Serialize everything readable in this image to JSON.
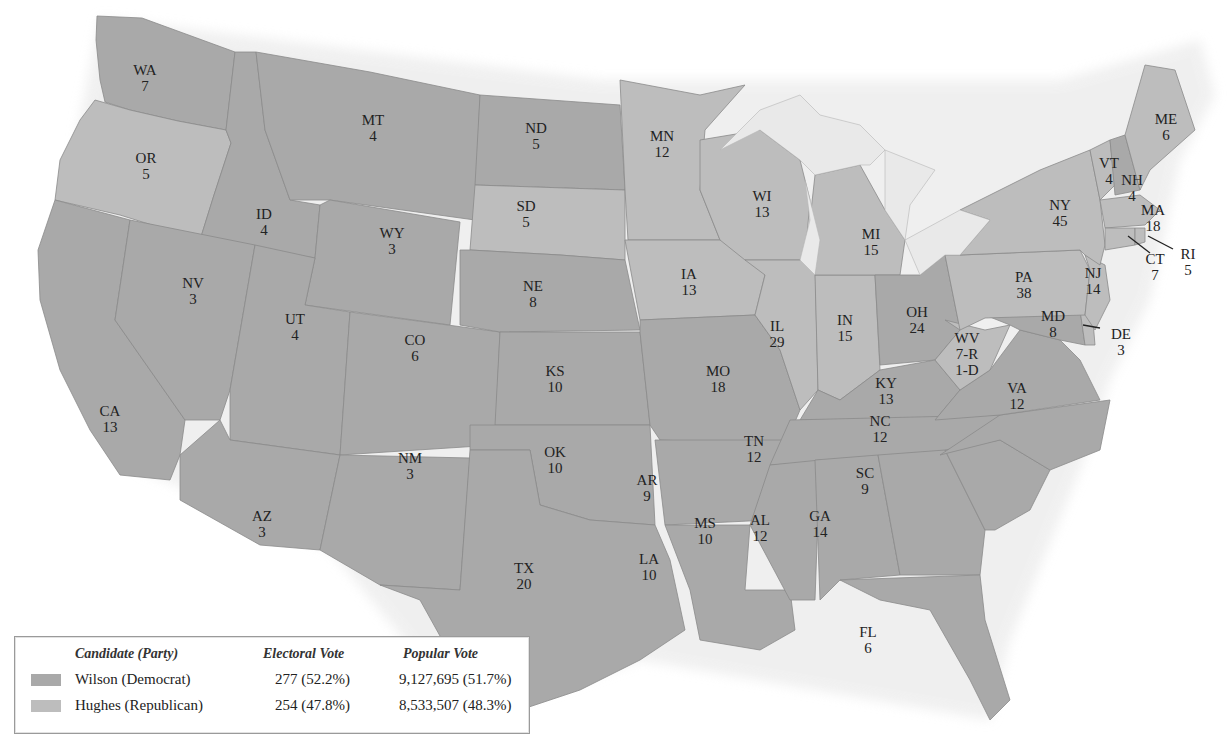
{
  "map": {
    "title": "",
    "states": [
      {
        "abbr": "WA",
        "ev": "7",
        "winner": "Wilson"
      },
      {
        "abbr": "OR",
        "ev": "5",
        "winner": "Hughes"
      },
      {
        "abbr": "CA",
        "ev": "13",
        "winner": "Wilson"
      },
      {
        "abbr": "ID",
        "ev": "4",
        "winner": "Wilson"
      },
      {
        "abbr": "NV",
        "ev": "3",
        "winner": "Wilson"
      },
      {
        "abbr": "MT",
        "ev": "4",
        "winner": "Wilson"
      },
      {
        "abbr": "WY",
        "ev": "3",
        "winner": "Wilson"
      },
      {
        "abbr": "UT",
        "ev": "4",
        "winner": "Wilson"
      },
      {
        "abbr": "AZ",
        "ev": "3",
        "winner": "Wilson"
      },
      {
        "abbr": "CO",
        "ev": "6",
        "winner": "Wilson"
      },
      {
        "abbr": "NM",
        "ev": "3",
        "winner": "Wilson"
      },
      {
        "abbr": "ND",
        "ev": "5",
        "winner": "Wilson"
      },
      {
        "abbr": "SD",
        "ev": "5",
        "winner": "Hughes"
      },
      {
        "abbr": "NE",
        "ev": "8",
        "winner": "Wilson"
      },
      {
        "abbr": "KS",
        "ev": "10",
        "winner": "Wilson"
      },
      {
        "abbr": "OK",
        "ev": "10",
        "winner": "Wilson"
      },
      {
        "abbr": "TX",
        "ev": "20",
        "winner": "Wilson"
      },
      {
        "abbr": "MN",
        "ev": "12",
        "winner": "Hughes"
      },
      {
        "abbr": "IA",
        "ev": "13",
        "winner": "Hughes"
      },
      {
        "abbr": "MO",
        "ev": "18",
        "winner": "Wilson"
      },
      {
        "abbr": "AR",
        "ev": "9",
        "winner": "Wilson"
      },
      {
        "abbr": "LA",
        "ev": "10",
        "winner": "Wilson"
      },
      {
        "abbr": "WI",
        "ev": "13",
        "winner": "Hughes"
      },
      {
        "abbr": "IL",
        "ev": "29",
        "winner": "Hughes"
      },
      {
        "abbr": "MI",
        "ev": "15",
        "winner": "Hughes"
      },
      {
        "abbr": "IN",
        "ev": "15",
        "winner": "Hughes"
      },
      {
        "abbr": "OH",
        "ev": "24",
        "winner": "Wilson"
      },
      {
        "abbr": "KY",
        "ev": "13",
        "winner": "Wilson"
      },
      {
        "abbr": "TN",
        "ev": "12",
        "winner": "Wilson"
      },
      {
        "abbr": "MS",
        "ev": "10",
        "winner": "Wilson"
      },
      {
        "abbr": "AL",
        "ev": "12",
        "winner": "Wilson"
      },
      {
        "abbr": "GA",
        "ev": "14",
        "winner": "Wilson"
      },
      {
        "abbr": "FL",
        "ev": "6",
        "winner": "Wilson"
      },
      {
        "abbr": "SC",
        "ev": "9",
        "winner": "Wilson"
      },
      {
        "abbr": "NC",
        "ev": "12",
        "winner": "Wilson"
      },
      {
        "abbr": "VA",
        "ev": "12",
        "winner": "Wilson"
      },
      {
        "abbr": "WV",
        "ev": "7-R 1-D",
        "winner": "Hughes (split)"
      },
      {
        "abbr": "MD",
        "ev": "8",
        "winner": "Wilson"
      },
      {
        "abbr": "DE",
        "ev": "3",
        "winner": "Hughes"
      },
      {
        "abbr": "PA",
        "ev": "38",
        "winner": "Hughes"
      },
      {
        "abbr": "NJ",
        "ev": "14",
        "winner": "Hughes"
      },
      {
        "abbr": "NY",
        "ev": "45",
        "winner": "Hughes"
      },
      {
        "abbr": "CT",
        "ev": "7",
        "winner": "Hughes"
      },
      {
        "abbr": "RI",
        "ev": "5",
        "winner": "Hughes"
      },
      {
        "abbr": "MA",
        "ev": "18",
        "winner": "Hughes"
      },
      {
        "abbr": "VT",
        "ev": "4",
        "winner": "Hughes"
      },
      {
        "abbr": "NH",
        "ev": "4",
        "winner": "Wilson"
      },
      {
        "abbr": "ME",
        "ev": "6",
        "winner": "Hughes"
      }
    ],
    "wv_lines": [
      "WV",
      "7-R",
      "1-D"
    ]
  },
  "legend": {
    "headers": {
      "candidate": "Candidate (Party)",
      "electoral": "Electoral Vote",
      "popular": "Popular Vote"
    },
    "rows": [
      {
        "candidate": "Wilson (Democrat)",
        "electoral": "277 (52.2%)",
        "popular": "9,127,695 (51.7%)",
        "color": "#a9a9a9"
      },
      {
        "candidate": "Hughes (Republican)",
        "electoral": "254 (47.8%)",
        "popular": "8,533,507 (48.3%)",
        "color": "#bdbdbd"
      }
    ]
  },
  "colors": {
    "wilson": "#a9a9a9",
    "hughes": "#bdbdbd",
    "lakes": "#e9e9e9",
    "border": "#8a8a8a"
  }
}
